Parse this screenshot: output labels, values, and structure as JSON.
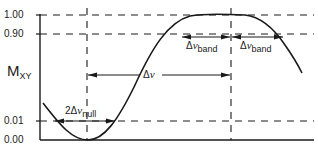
{
  "diagram": {
    "y_axis": {
      "label_main": "M",
      "label_sub": "XY",
      "ticks": [
        "1.00",
        "0.90",
        "0.01",
        "0.00"
      ]
    },
    "annotations": {
      "null_width": {
        "prefix": "2",
        "delta": "Δ",
        "var": "ν",
        "sub": "null"
      },
      "delta_nu": {
        "delta": "Δ",
        "var": "ν"
      },
      "band_left": {
        "delta": "Δ",
        "var": "ν",
        "sub": "band"
      },
      "band_right": {
        "delta": "Δ",
        "var": "ν",
        "sub": "band"
      }
    },
    "colors": {
      "line": "#1a1a1a",
      "background": "#ffffff"
    }
  }
}
